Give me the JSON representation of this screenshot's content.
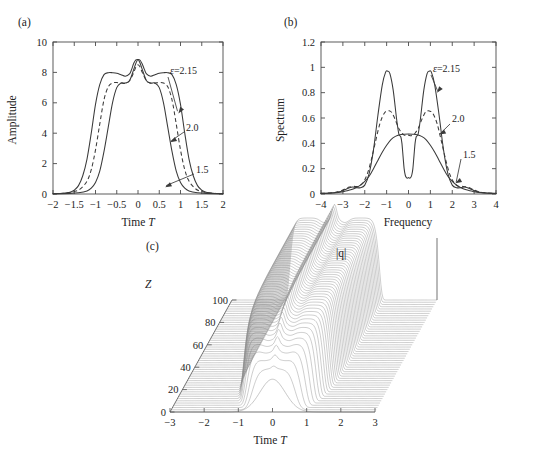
{
  "figure": {
    "kind": "multi-panel scientific figure",
    "panels": [
      "(a)",
      "(b)",
      "(c)"
    ]
  },
  "panel_a": {
    "tag": "(a)",
    "ylabel": "Amplitude",
    "xlabel_text": "Time ",
    "xlabel_var": "T",
    "xticks": [
      "−2",
      "−1.5",
      "−1",
      "−0.5",
      "0",
      "0.5",
      "1",
      "1.5",
      "2"
    ],
    "yticks": [
      "0",
      "2",
      "4",
      "6",
      "8",
      "10"
    ],
    "annotations": [
      {
        "label": "ε=2.15"
      },
      {
        "label": "2.0"
      },
      {
        "label": "1.5"
      }
    ]
  },
  "panel_b": {
    "tag": "(b)",
    "ylabel": "Spectrum",
    "xlabel_text": "Frequency",
    "xticks": [
      "−4",
      "−3",
      "−2",
      "−1",
      "0",
      "1",
      "2",
      "3",
      "4"
    ],
    "yticks": [
      "0",
      "0.2",
      "0.4",
      "0.6",
      "0.8",
      "1",
      "1.2"
    ],
    "annotations": [
      {
        "label": "ε=2.15"
      },
      {
        "label": "2.0"
      },
      {
        "label": "1.5"
      }
    ]
  },
  "panel_c": {
    "tag": "(c)",
    "zlabel": "Z",
    "surface_label": "|q|",
    "xlabel_text": "Time ",
    "xlabel_var": "T",
    "xticks": [
      "−3",
      "−2",
      "−1",
      "0",
      "1",
      "2",
      "3"
    ],
    "zticks": [
      "0",
      "20",
      "40",
      "60",
      "80",
      "100"
    ]
  },
  "style": {
    "ink": "#1d1d1d",
    "axis": "#4a4a4a",
    "curve": "#3a3a3a",
    "mesh": "#8a8a8a",
    "background": "#ffffff"
  },
  "chart_data": [
    {
      "id": "panel_a",
      "type": "line",
      "title": "(a)",
      "xlabel": "Time T",
      "ylabel": "Amplitude",
      "xlim": [
        -2,
        2
      ],
      "ylim": [
        0,
        10
      ],
      "xticks": [
        -2,
        -1.5,
        -1,
        -0.5,
        0,
        0.5,
        1,
        1.5,
        2
      ],
      "yticks": [
        0,
        2,
        4,
        6,
        8,
        10
      ],
      "grid": false,
      "legend": "inline-annotations",
      "series": [
        {
          "name": "ε=2.15",
          "style": "solid",
          "note": "widest flat-top pulse, plateau ≈8, central spike ≈8.85, shoulder dips ≈7.75",
          "x": [
            -2.0,
            -1.75,
            -1.6,
            -1.5,
            -1.4,
            -1.3,
            -1.2,
            -1.1,
            -1.0,
            -0.9,
            -0.8,
            -0.7,
            -0.6,
            -0.5,
            -0.4,
            -0.3,
            -0.2,
            -0.15,
            -0.1,
            -0.05,
            0.0,
            0.05,
            0.1,
            0.15,
            0.2,
            0.3,
            0.4,
            0.5,
            0.6,
            0.7,
            0.8,
            0.9,
            1.0,
            1.1,
            1.2,
            1.3,
            1.4,
            1.5,
            1.6,
            1.75,
            2.0
          ],
          "y": [
            0.02,
            0.05,
            0.12,
            0.25,
            0.55,
            1.2,
            2.3,
            4.0,
            5.9,
            7.2,
            7.85,
            7.98,
            7.98,
            7.95,
            7.85,
            7.75,
            7.9,
            8.2,
            8.6,
            8.82,
            8.85,
            8.8,
            8.55,
            8.2,
            7.9,
            7.75,
            7.85,
            7.95,
            7.98,
            7.98,
            7.85,
            7.2,
            5.9,
            4.0,
            2.3,
            1.2,
            0.55,
            0.25,
            0.12,
            0.05,
            0.02
          ]
        },
        {
          "name": "2.0",
          "style": "dashed",
          "note": "intermediate flat-top, plateau ≈7.3, central spike ≈8.5",
          "x": [
            -2.0,
            -1.7,
            -1.5,
            -1.35,
            -1.2,
            -1.1,
            -1.0,
            -0.9,
            -0.8,
            -0.7,
            -0.6,
            -0.5,
            -0.4,
            -0.3,
            -0.2,
            -0.1,
            -0.05,
            0.0,
            0.05,
            0.1,
            0.2,
            0.3,
            0.4,
            0.5,
            0.6,
            0.7,
            0.8,
            0.9,
            1.0,
            1.1,
            1.2,
            1.35,
            1.5,
            1.7,
            2.0
          ],
          "y": [
            0.02,
            0.06,
            0.16,
            0.35,
            0.85,
            1.6,
            2.9,
            4.6,
            6.2,
            7.05,
            7.3,
            7.33,
            7.3,
            7.28,
            7.45,
            8.0,
            8.35,
            8.5,
            8.35,
            8.0,
            7.45,
            7.28,
            7.3,
            7.33,
            7.3,
            7.05,
            6.2,
            4.6,
            2.9,
            1.6,
            0.85,
            0.35,
            0.16,
            0.06,
            0.02
          ]
        },
        {
          "name": "1.5",
          "style": "solid",
          "note": "narrowest pulse, rounded double-hump top, peak ≈8.85 at center, shoulders ≈7.3",
          "x": [
            -2.0,
            -1.6,
            -1.4,
            -1.2,
            -1.1,
            -1.0,
            -0.9,
            -0.8,
            -0.7,
            -0.6,
            -0.5,
            -0.4,
            -0.3,
            -0.2,
            -0.1,
            -0.05,
            0.0,
            0.05,
            0.1,
            0.2,
            0.3,
            0.4,
            0.5,
            0.6,
            0.7,
            0.8,
            0.9,
            1.0,
            1.1,
            1.2,
            1.4,
            1.6,
            2.0
          ],
          "y": [
            0.02,
            0.04,
            0.08,
            0.2,
            0.38,
            0.75,
            1.5,
            2.8,
            4.4,
            6.0,
            7.0,
            7.3,
            7.3,
            7.45,
            8.2,
            8.6,
            8.85,
            8.6,
            8.2,
            7.45,
            7.3,
            7.3,
            7.0,
            6.0,
            4.4,
            2.8,
            1.5,
            0.75,
            0.38,
            0.2,
            0.08,
            0.04,
            0.02
          ]
        }
      ]
    },
    {
      "id": "panel_b",
      "type": "line",
      "title": "(b)",
      "xlabel": "Frequency",
      "ylabel": "Spectrum",
      "xlim": [
        -4,
        4
      ],
      "ylim": [
        0,
        1.2
      ],
      "xticks": [
        -4,
        -3,
        -2,
        -1,
        0,
        1,
        2,
        3,
        4
      ],
      "yticks": [
        0,
        0.2,
        0.4,
        0.6,
        0.8,
        1.0,
        1.2
      ],
      "grid": false,
      "legend": "inline-annotations",
      "series": [
        {
          "name": "ε=2.15",
          "style": "solid",
          "note": "twin peaks ≈0.97 at ±1, deep narrow central box dipping to ≈0.13",
          "x": [
            -4.0,
            -3.4,
            -3.1,
            -2.9,
            -2.7,
            -2.55,
            -2.4,
            -2.2,
            -2.0,
            -1.8,
            -1.6,
            -1.4,
            -1.2,
            -1.05,
            -0.95,
            -0.85,
            -0.7,
            -0.55,
            -0.45,
            -0.4,
            -0.35,
            -0.3,
            -0.25,
            -0.2,
            -0.15,
            -0.1,
            -0.05,
            0.0,
            0.05,
            0.1,
            0.15,
            0.2,
            0.25,
            0.3,
            0.35,
            0.4,
            0.45,
            0.55,
            0.7,
            0.85,
            0.95,
            1.05,
            1.2,
            1.4,
            1.6,
            1.8,
            2.0,
            2.2,
            2.4,
            2.55,
            2.7,
            2.9,
            3.1,
            3.4,
            4.0
          ],
          "y": [
            0.005,
            0.01,
            0.02,
            0.035,
            0.05,
            0.055,
            0.05,
            0.05,
            0.07,
            0.16,
            0.35,
            0.62,
            0.86,
            0.96,
            0.97,
            0.95,
            0.82,
            0.6,
            0.48,
            0.46,
            0.45,
            0.4,
            0.3,
            0.2,
            0.15,
            0.13,
            0.125,
            0.13,
            0.125,
            0.13,
            0.15,
            0.2,
            0.3,
            0.4,
            0.45,
            0.46,
            0.48,
            0.6,
            0.82,
            0.95,
            0.97,
            0.96,
            0.86,
            0.62,
            0.35,
            0.16,
            0.07,
            0.05,
            0.05,
            0.055,
            0.05,
            0.035,
            0.02,
            0.01,
            0.005
          ]
        },
        {
          "name": "2.0",
          "style": "dashed",
          "note": "twin peaks ≈0.655 at ±0.85, central shoulder ≈0.47",
          "x": [
            -4.0,
            -3.4,
            -3.1,
            -2.9,
            -2.7,
            -2.5,
            -2.3,
            -2.1,
            -1.9,
            -1.7,
            -1.5,
            -1.3,
            -1.1,
            -0.95,
            -0.85,
            -0.75,
            -0.6,
            -0.45,
            -0.3,
            -0.2,
            -0.1,
            0.0,
            0.1,
            0.2,
            0.3,
            0.45,
            0.6,
            0.75,
            0.85,
            0.95,
            1.1,
            1.3,
            1.5,
            1.7,
            1.9,
            2.1,
            2.3,
            2.5,
            2.7,
            2.9,
            3.1,
            3.4,
            4.0
          ],
          "y": [
            0.005,
            0.012,
            0.025,
            0.04,
            0.055,
            0.06,
            0.06,
            0.085,
            0.15,
            0.27,
            0.42,
            0.56,
            0.64,
            0.655,
            0.655,
            0.64,
            0.585,
            0.52,
            0.48,
            0.465,
            0.46,
            0.465,
            0.46,
            0.465,
            0.48,
            0.52,
            0.585,
            0.64,
            0.655,
            0.655,
            0.64,
            0.56,
            0.42,
            0.27,
            0.15,
            0.085,
            0.06,
            0.06,
            0.055,
            0.04,
            0.025,
            0.012,
            0.005
          ]
        },
        {
          "name": "1.5",
          "style": "solid",
          "note": "single broad hump peaking ≈0.47 at 0",
          "x": [
            -4.0,
            -3.5,
            -3.2,
            -3.0,
            -2.8,
            -2.6,
            -2.4,
            -2.2,
            -2.0,
            -1.8,
            -1.6,
            -1.4,
            -1.2,
            -1.0,
            -0.8,
            -0.6,
            -0.4,
            -0.2,
            0.0,
            0.2,
            0.4,
            0.6,
            0.8,
            1.0,
            1.2,
            1.4,
            1.6,
            1.8,
            2.0,
            2.2,
            2.4,
            2.6,
            2.8,
            3.0,
            3.2,
            3.5,
            4.0
          ],
          "y": [
            0.004,
            0.008,
            0.012,
            0.018,
            0.025,
            0.035,
            0.05,
            0.07,
            0.1,
            0.14,
            0.2,
            0.265,
            0.33,
            0.385,
            0.43,
            0.455,
            0.468,
            0.472,
            0.473,
            0.472,
            0.468,
            0.455,
            0.43,
            0.385,
            0.33,
            0.265,
            0.2,
            0.14,
            0.1,
            0.07,
            0.05,
            0.035,
            0.025,
            0.018,
            0.012,
            0.008,
            0.004
          ]
        }
      ]
    },
    {
      "id": "panel_c",
      "type": "surface",
      "title": "(c)",
      "xlabel": "Time T",
      "zlabel": "Z",
      "vlabel": "|q|",
      "xlim": [
        -3,
        3
      ],
      "zlim": [
        0,
        100
      ],
      "xticks": [
        -3,
        -2,
        -1,
        0,
        1,
        2,
        3
      ],
      "zticks": [
        0,
        20,
        40,
        60,
        80,
        100
      ],
      "n_traces": 50,
      "note": "waterfall / mesh surface: pulse starts at Z=0 as a single rounded hump of modest height, broadens and flattens with propagation into a wide flat-topped pulse (|T|<~1.3) carrying a narrow central spike; amplitude saturates by Z≈30 and remains steady to Z=100",
      "traces": [
        {
          "z": 0,
          "peak": 0.42,
          "width": 0.55,
          "shape": "single rounded hump"
        },
        {
          "z": 10,
          "peak": 0.62,
          "width": 0.8,
          "shape": "broadening hump, flattening top"
        },
        {
          "z": 20,
          "peak": 0.82,
          "width": 1.05,
          "shape": "flat top forming, shoulders rising"
        },
        {
          "z": 30,
          "peak": 0.95,
          "width": 1.2,
          "shape": "flat-top with central spike"
        },
        {
          "z": 40,
          "peak": 1.0,
          "width": 1.28,
          "shape": "saturated flat-top, central spike"
        },
        {
          "z": 60,
          "peak": 1.0,
          "width": 1.3,
          "shape": "steady flat-top, central spike"
        },
        {
          "z": 80,
          "peak": 1.0,
          "width": 1.3,
          "shape": "steady flat-top, central spike"
        },
        {
          "z": 100,
          "peak": 1.0,
          "width": 1.3,
          "shape": "steady flat-top, central spike"
        }
      ]
    }
  ]
}
